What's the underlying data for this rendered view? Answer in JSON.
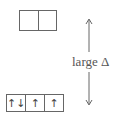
{
  "diagram": {
    "upper_level": {
      "orbitals": [
        "",
        ""
      ]
    },
    "lower_level": {
      "orbitals": [
        "↑↓",
        "↑",
        "↑"
      ]
    },
    "gap_label": "large Δ",
    "colors": {
      "line": "#666666",
      "text": "#555555"
    }
  }
}
